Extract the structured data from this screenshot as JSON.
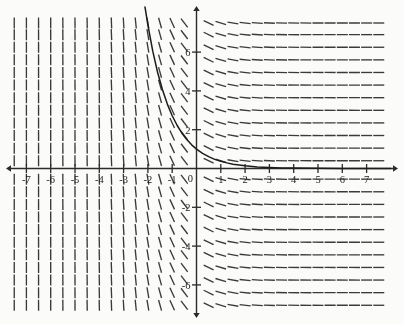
{
  "figure": {
    "kind": "slope-field-with-solution-curve",
    "background_color": "#fbfbfa",
    "ink_color": "#2b2b2b"
  },
  "chart_data": {
    "type": "line",
    "title": "",
    "subtitle": "",
    "xlabel": "",
    "ylabel": "",
    "grid": false,
    "legend": null,
    "xlim": [
      -8.1,
      8.1
    ],
    "ylim": [
      -7.6,
      7.9
    ],
    "x_ticks": [
      -7,
      -6,
      -5,
      -4,
      -3,
      -2,
      -1,
      1,
      2,
      3,
      4,
      5,
      6,
      7
    ],
    "x_tick_labels": [
      "-7",
      "-6",
      "-5",
      "-4",
      "-3",
      "-2",
      "-1",
      "1",
      "2",
      "3",
      "4",
      "5",
      "6",
      "7"
    ],
    "y_ticks": [
      -6,
      -4,
      -2,
      2,
      4,
      6
    ],
    "y_tick_labels": [
      "-6",
      "-4",
      "-2",
      "2",
      "4",
      "6"
    ],
    "origin_label": "0",
    "axis_arrows": [
      "left",
      "right",
      "up",
      "down"
    ],
    "series": [
      {
        "name": "solution curve",
        "equation": "y = e^(-x)",
        "style": "solid",
        "color": "#1c1c1c",
        "x": [
          -2.12,
          -2.0,
          -1.8,
          -1.6,
          -1.4,
          -1.2,
          -1.0,
          -0.8,
          -0.6,
          -0.4,
          -0.2,
          0.0,
          0.25,
          0.5,
          0.75,
          1.0,
          1.25,
          1.5,
          2.0,
          2.5,
          3.0,
          3.5,
          4.0,
          5.0,
          6.0,
          7.0,
          8.0
        ],
        "y": [
          8.33,
          7.39,
          6.05,
          4.95,
          4.06,
          3.32,
          2.72,
          2.23,
          1.82,
          1.49,
          1.22,
          1.0,
          0.78,
          0.61,
          0.47,
          0.37,
          0.29,
          0.22,
          0.14,
          0.08,
          0.05,
          0.03,
          0.02,
          0.007,
          0.002,
          0.001,
          0.0
        ]
      }
    ],
    "slope_field": {
      "description": "short dashes whose slope depends only on x",
      "slope_equation": "dy/dx = -e^(-x)",
      "x_samples": [
        -7.5,
        -7.0,
        -6.5,
        -6.0,
        -5.5,
        -5.0,
        -4.5,
        -4.0,
        -3.5,
        -3.0,
        -2.5,
        -2.0,
        -1.5,
        -1.0,
        -0.5,
        0.5,
        1.0,
        1.5,
        2.0,
        2.5,
        3.0,
        3.5,
        4.0,
        4.5,
        5.0,
        5.5,
        6.0,
        6.5,
        7.0,
        7.5
      ],
      "y_samples": [
        7.5,
        6.9,
        6.25,
        5.6,
        4.95,
        4.3,
        3.65,
        3.0,
        2.35,
        1.7,
        1.05,
        0.4,
        -0.55,
        -1.2,
        -1.85,
        -2.5,
        -3.15,
        -3.8,
        -4.45,
        -5.1,
        -5.75,
        -6.4,
        -7.05
      ],
      "segment_length_px": 11,
      "color": "#3a3a3a"
    }
  }
}
